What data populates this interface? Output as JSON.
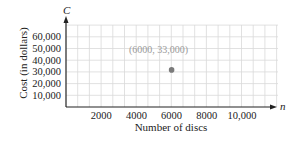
{
  "chart_data": {
    "type": "scatter",
    "title": "",
    "xlabel": "Number of discs",
    "ylabel": "Cost (in dollars)",
    "x_var": "n",
    "y_var": "C",
    "xlim": [
      0,
      12000
    ],
    "ylim": [
      0,
      70000
    ],
    "x_ticks": [
      2000,
      4000,
      6000,
      8000,
      10000
    ],
    "x_tick_labels": [
      "2000",
      "4000",
      "6000",
      "8000",
      "10,000"
    ],
    "y_ticks": [
      10000,
      20000,
      30000,
      40000,
      50000,
      60000
    ],
    "y_tick_labels": [
      "10,000",
      "20,000",
      "30,000",
      "40,000",
      "50,000",
      "60,000"
    ],
    "grid": true,
    "legend": null,
    "points": [
      {
        "x": 6000,
        "y": 33000,
        "label": "(6000, 33,000)"
      }
    ],
    "colors": {
      "grid": "#d9d9d9",
      "axis": "#222222",
      "point": "#7a7a7a",
      "point_label": "#9a9a9a"
    }
  }
}
